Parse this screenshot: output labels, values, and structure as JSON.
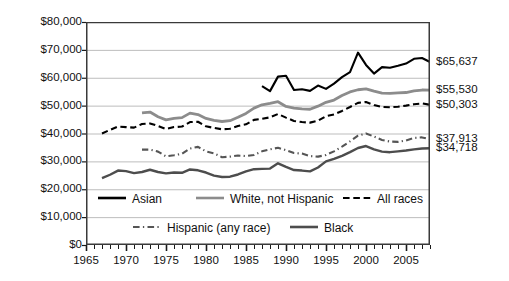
{
  "chart_data": {
    "type": "line",
    "title": "",
    "xlabel": "",
    "ylabel": "2008 dollars",
    "xlim": [
      1965,
      2008
    ],
    "ylim": [
      0,
      80000
    ],
    "grid": true,
    "legend_position": "inside-bottom",
    "y_ticks": [
      "$0",
      "$10,000",
      "$20,000",
      "$30,000",
      "$40,000",
      "$50,000",
      "$60,000",
      "$70,000",
      "$80,000"
    ],
    "y_tick_values": [
      0,
      10000,
      20000,
      30000,
      40000,
      50000,
      60000,
      70000,
      80000
    ],
    "x_ticks": [
      "1965",
      "1970",
      "1975",
      "1980",
      "1985",
      "1990",
      "1995",
      "2000",
      "2005"
    ],
    "x_tick_values": [
      1965,
      1970,
      1975,
      1980,
      1985,
      1990,
      1995,
      2000,
      2005
    ],
    "x_minor_tick_interval": 1,
    "end_labels": [
      {
        "series": "Asian",
        "text": "$65,637",
        "value": 65637
      },
      {
        "series": "White, not Hispanic",
        "text": "$55,530",
        "value": 55530
      },
      {
        "series": "All races",
        "text": "$50,303",
        "value": 50303
      },
      {
        "series": "Hispanic (any race)",
        "text": "$37,913",
        "value": 37913
      },
      {
        "series": "Black",
        "text": "$34,718",
        "value": 34718
      }
    ],
    "series": [
      {
        "name": "Asian",
        "color": "#000000",
        "style": "solid",
        "width": 2.1,
        "x": [
          1987,
          1988,
          1989,
          1990,
          1991,
          1992,
          1993,
          1994,
          1995,
          1996,
          1997,
          1998,
          1999,
          2000,
          2001,
          2002,
          2003,
          2004,
          2005,
          2006,
          2007,
          2008
        ],
        "values": [
          57000,
          55200,
          60400,
          60700,
          55600,
          55900,
          55300,
          57200,
          56000,
          57900,
          60200,
          62000,
          69000,
          64600,
          61500,
          63800,
          63600,
          64300,
          65100,
          66800,
          67100,
          65637
        ]
      },
      {
        "name": "White, not Hispanic",
        "color": "#8c8c8c",
        "style": "solid",
        "width": 2.8,
        "x": [
          1972,
          1973,
          1974,
          1975,
          1976,
          1977,
          1978,
          1979,
          1980,
          1981,
          1982,
          1983,
          1984,
          1985,
          1986,
          1987,
          1988,
          1989,
          1990,
          1991,
          1992,
          1993,
          1994,
          1995,
          1996,
          1997,
          1998,
          1999,
          2000,
          2001,
          2002,
          2003,
          2004,
          2005,
          2006,
          2007,
          2008
        ],
        "values": [
          47400,
          47700,
          46000,
          44900,
          45400,
          45700,
          47300,
          46800,
          45400,
          44700,
          44300,
          44600,
          45800,
          47200,
          49100,
          50300,
          50800,
          51400,
          49700,
          49100,
          48800,
          48700,
          49800,
          51200,
          52000,
          53600,
          54900,
          55700,
          56000,
          55200,
          54500,
          54400,
          54600,
          54700,
          55300,
          55600,
          55530
        ]
      },
      {
        "name": "All races",
        "color": "#000000",
        "style": "dashed",
        "width": 2.1,
        "x": [
          1967,
          1968,
          1969,
          1970,
          1971,
          1972,
          1973,
          1974,
          1975,
          1976,
          1977,
          1978,
          1979,
          1980,
          1981,
          1982,
          1983,
          1984,
          1985,
          1986,
          1987,
          1988,
          1989,
          1990,
          1991,
          1992,
          1993,
          1994,
          1995,
          1996,
          1997,
          1998,
          1999,
          2000,
          2001,
          2002,
          2003,
          2004,
          2005,
          2006,
          2007,
          2008
        ],
        "values": [
          40000,
          41300,
          42500,
          42300,
          42100,
          43400,
          43600,
          42700,
          41600,
          42300,
          42500,
          44100,
          44200,
          42600,
          42000,
          41500,
          41700,
          42700,
          43300,
          44900,
          45300,
          45800,
          47000,
          45700,
          44500,
          44100,
          43900,
          44600,
          46200,
          46800,
          48100,
          49500,
          51000,
          51300,
          50200,
          49500,
          49400,
          49600,
          50000,
          50500,
          50800,
          50303
        ]
      },
      {
        "name": "Hispanic (any race)",
        "color": "#555555",
        "style": "dashdot",
        "width": 2.1,
        "x": [
          1972,
          1973,
          1974,
          1975,
          1976,
          1977,
          1978,
          1979,
          1980,
          1981,
          1982,
          1983,
          1984,
          1985,
          1986,
          1987,
          1988,
          1989,
          1990,
          1991,
          1992,
          1993,
          1994,
          1995,
          1996,
          1997,
          1998,
          1999,
          2000,
          2001,
          2002,
          2003,
          2004,
          2005,
          2006,
          2007,
          2008
        ],
        "values": [
          34200,
          34200,
          33500,
          31800,
          32200,
          32700,
          34600,
          35200,
          33600,
          32900,
          31500,
          31700,
          32100,
          31900,
          32300,
          33600,
          34300,
          34900,
          34000,
          33000,
          32800,
          31900,
          31700,
          32300,
          33600,
          35300,
          37200,
          39200,
          40000,
          38900,
          37700,
          37100,
          37000,
          37500,
          38400,
          38600,
          37913
        ]
      },
      {
        "name": "Black",
        "color": "#4d4d4d",
        "style": "solid",
        "width": 2.4,
        "x": [
          1967,
          1968,
          1969,
          1970,
          1971,
          1972,
          1973,
          1974,
          1975,
          1976,
          1977,
          1978,
          1979,
          1980,
          1981,
          1982,
          1983,
          1984,
          1985,
          1986,
          1987,
          1988,
          1989,
          1990,
          1991,
          1992,
          1993,
          1994,
          1995,
          1996,
          1997,
          1998,
          1999,
          2000,
          2001,
          2002,
          2003,
          2004,
          2005,
          2006,
          2007,
          2008
        ],
        "values": [
          24000,
          25200,
          26700,
          26500,
          25800,
          26200,
          27000,
          26200,
          25700,
          26000,
          25900,
          27100,
          26800,
          26000,
          24900,
          24400,
          24500,
          25300,
          26400,
          27200,
          27300,
          27400,
          29300,
          28000,
          26900,
          26700,
          26400,
          27800,
          30000,
          30900,
          32000,
          33300,
          34800,
          35500,
          34300,
          33500,
          33300,
          33600,
          33900,
          34300,
          34600,
          34718
        ]
      }
    ]
  },
  "legend": {
    "row1": [
      {
        "label": "Asian",
        "style": "solid",
        "color": "#000000"
      },
      {
        "label": "White, not Hispanic",
        "style": "solid",
        "color": "#8c8c8c"
      },
      {
        "label": "All races",
        "style": "dashed",
        "color": "#000000"
      }
    ],
    "row2": [
      {
        "label": "Hispanic (any race)",
        "style": "dashdot",
        "color": "#555555"
      },
      {
        "label": "Black",
        "style": "solid",
        "color": "#4d4d4d"
      }
    ]
  }
}
